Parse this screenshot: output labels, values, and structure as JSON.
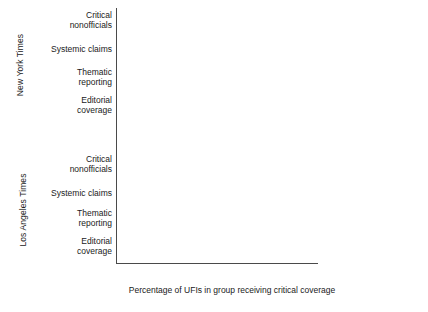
{
  "chart_data": {
    "type": "bar",
    "orientation": "horizontal",
    "title": "",
    "xlabel": "Percentage of UFIs in group receiving critical coverage",
    "ylabel": "",
    "xlim": [
      0,
      100
    ],
    "xticks": [
      0,
      20,
      40,
      60,
      80,
      100
    ],
    "xtick_labels": [
      "0",
      "20",
      "40",
      "60",
      "80",
      "100"
    ],
    "grid": false,
    "legend_position": "right",
    "legend": [
      "High-profile UFIs",
      "Mid-profile UFIs",
      "Low-profile UFIs"
    ],
    "series_colors": {
      "high": "#8c8c8c",
      "mid": "#c4c4c4",
      "low": "#2b2b2b"
    },
    "panels": [
      {
        "name": "New York Times",
        "categories": [
          "Critical nonofficials",
          "Systemic claims",
          "Thematic reporting",
          "Editorial coverage"
        ],
        "series": [
          {
            "name": "High-profile UFIs",
            "key": "high",
            "values": [
              89,
              100,
              89,
              77
            ]
          },
          {
            "name": "Mid-profile UFIs",
            "key": "mid",
            "values": [
              50,
              41,
              41,
              23
            ]
          },
          {
            "name": "Low-profile UFIs",
            "key": "low",
            "values": [
              14,
              12,
              3,
              1
            ]
          }
        ]
      },
      {
        "name": "Los Angeles Times",
        "categories": [
          "Critical nonofficials",
          "Systemic claims",
          "Thematic reporting",
          "Editorial coverage"
        ],
        "series": [
          {
            "name": "High-profile UFIs",
            "key": "high",
            "values": [
              84,
              100,
              50,
              83
            ]
          },
          {
            "name": "Mid-profile UFIs",
            "key": "mid",
            "values": [
              33,
              26,
              18,
              16
            ]
          },
          {
            "name": "Low-profile UFIs",
            "key": "low",
            "values": [
              8,
              4,
              1,
              1
            ]
          }
        ]
      }
    ]
  },
  "panel_titles": {
    "nyt": "New York Times",
    "lat": "Los Angeles Times"
  },
  "category_labels": {
    "critical_line1": "Critical",
    "critical_line2": "nonofficials",
    "systemic": "Systemic claims",
    "thematic_line1": "Thematic",
    "thematic_line2": "reporting",
    "editorial_line1": "Editorial",
    "editorial_line2": "coverage"
  },
  "axis": {
    "x_title": "Percentage of UFIs in group receiving critical coverage",
    "ticks": [
      "0",
      "20",
      "40",
      "60",
      "80",
      "100"
    ]
  },
  "legend": {
    "items": [
      {
        "label": "High-profile UFIs",
        "key": "high"
      },
      {
        "label": "Mid-profile UFIs",
        "key": "mid"
      },
      {
        "label": "Low-profile UFIs",
        "key": "low"
      }
    ]
  }
}
